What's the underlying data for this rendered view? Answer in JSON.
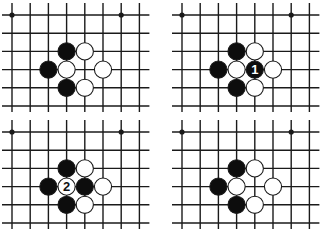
{
  "diagram": {
    "type": "go-board-sequence",
    "layout": {
      "columns": 2,
      "rows": 2
    },
    "colors": {
      "background": "#ffffff",
      "line": "#1a1a1a",
      "black_stone": "#0d0d0d",
      "white_stone": "#ffffff",
      "stone_outline": "#1a1a1a"
    },
    "board": {
      "cols": 8,
      "rows": 6,
      "star_points": [
        [
          0,
          0
        ],
        [
          6,
          0
        ]
      ]
    },
    "panels": [
      {
        "id": "panel-1",
        "black": [
          [
            3,
            2
          ],
          [
            2,
            3
          ],
          [
            3,
            4
          ]
        ],
        "white": [
          [
            4,
            2
          ],
          [
            3,
            3
          ],
          [
            5,
            3
          ],
          [
            4,
            4
          ]
        ],
        "labels": []
      },
      {
        "id": "panel-2",
        "black": [
          [
            3,
            2
          ],
          [
            2,
            3
          ],
          [
            3,
            4
          ],
          [
            4,
            3
          ]
        ],
        "white": [
          [
            4,
            2
          ],
          [
            3,
            3
          ],
          [
            5,
            3
          ],
          [
            4,
            4
          ]
        ],
        "labels": [
          {
            "pos": [
              4,
              3
            ],
            "color": "black",
            "text": "1"
          }
        ]
      },
      {
        "id": "panel-3",
        "black": [
          [
            3,
            2
          ],
          [
            2,
            3
          ],
          [
            4,
            3
          ],
          [
            3,
            4
          ]
        ],
        "white": [
          [
            4,
            2
          ],
          [
            5,
            3
          ],
          [
            4,
            4
          ],
          [
            3,
            3
          ]
        ],
        "labels": [
          {
            "pos": [
              3,
              3
            ],
            "color": "white",
            "text": "2"
          }
        ]
      },
      {
        "id": "panel-4",
        "black": [
          [
            3,
            2
          ],
          [
            2,
            3
          ],
          [
            3,
            4
          ]
        ],
        "white": [
          [
            4,
            2
          ],
          [
            3,
            3
          ],
          [
            5,
            3
          ],
          [
            4,
            4
          ]
        ],
        "labels": []
      }
    ]
  }
}
